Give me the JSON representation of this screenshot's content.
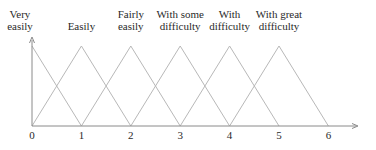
{
  "diagram": {
    "title": "",
    "type": "triangular fuzzy membership functions",
    "x_axis": {
      "ticks": [
        "0",
        "1",
        "2",
        "3",
        "4",
        "5",
        "6"
      ],
      "arrow": true
    },
    "y_axis": {
      "arrow": true
    },
    "sets": [
      {
        "label_line1": "Very",
        "label_line2": "easily",
        "left": 0,
        "peak": 0,
        "right": 1
      },
      {
        "label_line1": "",
        "label_line2": "Easily",
        "left": 0,
        "peak": 1,
        "right": 2
      },
      {
        "label_line1": "Fairly",
        "label_line2": "easily",
        "left": 1,
        "peak": 2,
        "right": 3
      },
      {
        "label_line1": "With some",
        "label_line2": "difficulty",
        "left": 2,
        "peak": 3,
        "right": 4
      },
      {
        "label_line1": "With",
        "label_line2": "difficulty",
        "left": 3,
        "peak": 4,
        "right": 5
      },
      {
        "label_line1": "With great",
        "label_line2": "difficulty",
        "left": 4,
        "peak": 5,
        "right": 6
      }
    ],
    "colors": {
      "axis": "#8a8a8a",
      "curve": "#b8b8b8",
      "text": "#2a2a2a"
    }
  }
}
